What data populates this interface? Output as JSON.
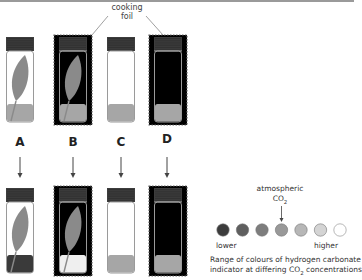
{
  "annotation": {
    "foil_label_line1": "cooking",
    "foil_label_line2": "foil"
  },
  "tubes": [
    {
      "id": "A",
      "label": "A",
      "foil": false,
      "leaf": true,
      "start_indicator": "#a6a6a6",
      "end_indicator": "#3a3a3a"
    },
    {
      "id": "B",
      "label": "B",
      "foil": true,
      "leaf": true,
      "start_indicator": "#a6a6a6",
      "end_indicator": "#efefef"
    },
    {
      "id": "C",
      "label": "C",
      "foil": false,
      "leaf": false,
      "start_indicator": "#a6a6a6",
      "end_indicator": "#a6a6a6"
    },
    {
      "id": "D",
      "label": "D",
      "foil": true,
      "leaf": false,
      "start_indicator": "#a6a6a6",
      "end_indicator": "#a6a6a6"
    }
  ],
  "key": {
    "marker_line1": "atmospheric",
    "marker_line2": "CO",
    "marker_sub": "2",
    "marker_index": 3,
    "scale_low": "lower",
    "scale_high": "higher",
    "swatches": [
      "#3c3c3c",
      "#5f5f5f",
      "#7d7d7d",
      "#999999",
      "#b7b7b7",
      "#d4d4d4",
      "#ffffff"
    ],
    "caption_line1": "Range of colours  of hydrogen carbonate",
    "caption_line2_pre": "indicator at differing CO",
    "caption_line2_sub": "2",
    "caption_line2_post": " concentrations"
  },
  "colors": {
    "cap": "#3d3d3d",
    "leaf": "#8a8a8a",
    "foil": "#000000",
    "tube_outline": "#9a9a9a"
  }
}
